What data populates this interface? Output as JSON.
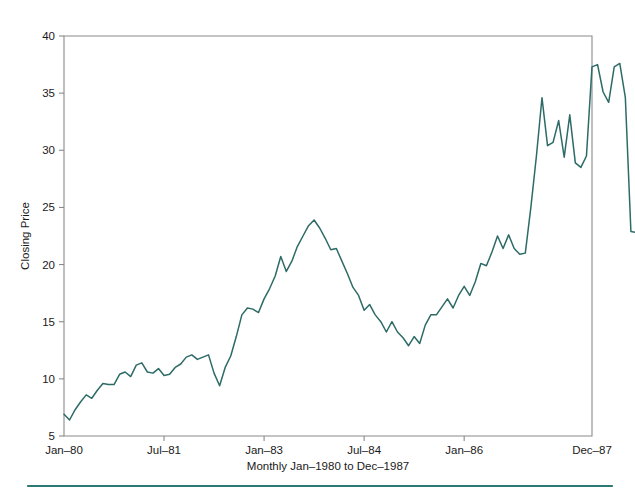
{
  "chart_data": {
    "type": "line",
    "title": "",
    "xlabel": "Monthly Jan–1980 to Dec–1987",
    "ylabel": "Closing Price",
    "grid": false,
    "legend": "none",
    "ylim": [
      5,
      40
    ],
    "y_ticks": [
      5,
      10,
      15,
      20,
      25,
      30,
      35,
      40
    ],
    "y_tick_labels": [
      "5",
      "10",
      "15",
      "20",
      "25",
      "30",
      "35",
      "40"
    ],
    "x_ticks": [
      0,
      18,
      36,
      54,
      72,
      95
    ],
    "x_tick_labels": [
      "Jan–80",
      "Jul–81",
      "Jan–83",
      "Jul–84",
      "Jan–86",
      "Dec–87"
    ],
    "x_range": [
      0,
      95
    ],
    "n_points": 96,
    "line_color": "#2d6b66",
    "series": [
      {
        "name": "Closing Price",
        "values": [
          6.9,
          6.4,
          7.3,
          8.0,
          8.6,
          8.3,
          9.0,
          9.6,
          9.5,
          9.5,
          10.4,
          10.6,
          10.2,
          11.2,
          11.4,
          10.6,
          10.5,
          10.9,
          10.3,
          10.4,
          11.0,
          11.3,
          11.9,
          12.1,
          11.7,
          11.9,
          12.1,
          10.5,
          9.4,
          11.0,
          12.0,
          13.7,
          15.6,
          16.2,
          16.1,
          15.8,
          17.0,
          17.9,
          19.0,
          20.7,
          19.4,
          20.3,
          21.6,
          22.5,
          23.4,
          23.9,
          23.2,
          22.3,
          21.3,
          21.4,
          20.3,
          19.2,
          18.0,
          17.3,
          16.0,
          16.5,
          15.6,
          15.0,
          14.1,
          15.0,
          14.1,
          13.6,
          12.9,
          13.7,
          13.1,
          14.7,
          15.6,
          15.6,
          16.3,
          17.0,
          16.2,
          17.3,
          18.1,
          17.3,
          18.5,
          20.1,
          19.9,
          21.1,
          22.5,
          21.4,
          22.6,
          21.4,
          20.9,
          21.0,
          25.0,
          29.5,
          34.6,
          30.4,
          30.7,
          32.6,
          29.4,
          33.1,
          28.9,
          28.5,
          29.5,
          37.3,
          37.5,
          35.1,
          34.2,
          37.3,
          37.6,
          34.6,
          22.9,
          22.8
        ]
      }
    ],
    "annotations": []
  },
  "figure": {
    "background_color": "#ffffff",
    "axis_color": "#8a8a8a",
    "text_color": "#1a1a1a",
    "accent_color": "#2d6b66",
    "footer_rule_color": "#2d7a72"
  }
}
